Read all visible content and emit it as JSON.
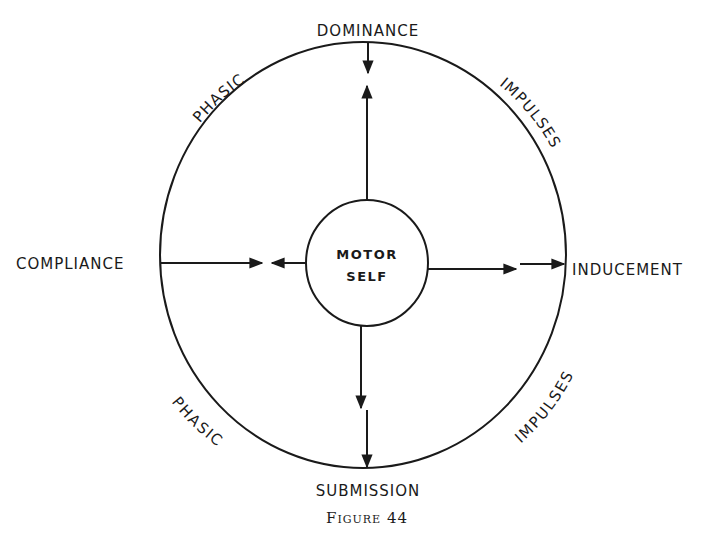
{
  "diagram": {
    "center_label_line1": "MOTOR",
    "center_label_line2": "SELF",
    "top_label": "DOMINANCE",
    "bottom_label": "SUBMISSION",
    "left_label": "COMPLIANCE",
    "right_label": "INDUCEMENT",
    "arc_labels": {
      "upper_left": "PHASIC",
      "upper_right": "IMPULSES",
      "lower_left": "PHASIC",
      "lower_right": "IMPULSES"
    },
    "caption": "Figure 44"
  }
}
